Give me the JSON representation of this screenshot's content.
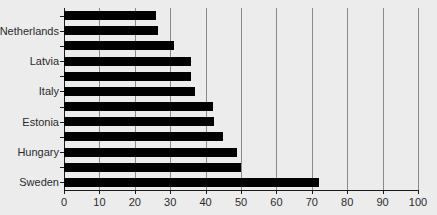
{
  "chart_data": {
    "type": "bar",
    "orientation": "horizontal",
    "title": "",
    "xlabel": "",
    "ylabel": "",
    "xlim": [
      0,
      100
    ],
    "ylim": null,
    "grid": true,
    "legend": null,
    "bar_color": "#000000",
    "background_color": "#ececed",
    "axis_color": "#1a1a1a",
    "gridline_color": "#8a8a8a",
    "xticks": [
      0,
      10,
      20,
      30,
      40,
      50,
      60,
      70,
      80,
      90,
      100
    ],
    "xtick_labels": [
      "0",
      "10",
      "20",
      "30",
      "40",
      "50",
      "60",
      "70",
      "80",
      "90",
      "100"
    ],
    "categories": [
      "",
      "Netherlands",
      "",
      "Latvia",
      "",
      "Italy",
      "",
      "Estonia",
      "",
      "Hungary",
      "",
      "Sweden"
    ],
    "visible_category_labels": [
      "Netherlands",
      "Latvia",
      "Italy",
      "Estonia",
      "Hungary",
      "Sweden"
    ],
    "values": [
      26,
      26.5,
      31,
      36,
      36,
      37,
      42,
      42.5,
      45,
      49,
      50,
      72
    ],
    "bars": [
      {
        "label": "",
        "value": 26
      },
      {
        "label": "Netherlands",
        "value": 26.5
      },
      {
        "label": "",
        "value": 31
      },
      {
        "label": "Latvia",
        "value": 36
      },
      {
        "label": "",
        "value": 36
      },
      {
        "label": "Italy",
        "value": 37
      },
      {
        "label": "",
        "value": 42
      },
      {
        "label": "Estonia",
        "value": 42.5
      },
      {
        "label": "",
        "value": 45
      },
      {
        "label": "Hungary",
        "value": 49
      },
      {
        "label": "",
        "value": 50
      },
      {
        "label": "Sweden",
        "value": 72
      }
    ]
  }
}
